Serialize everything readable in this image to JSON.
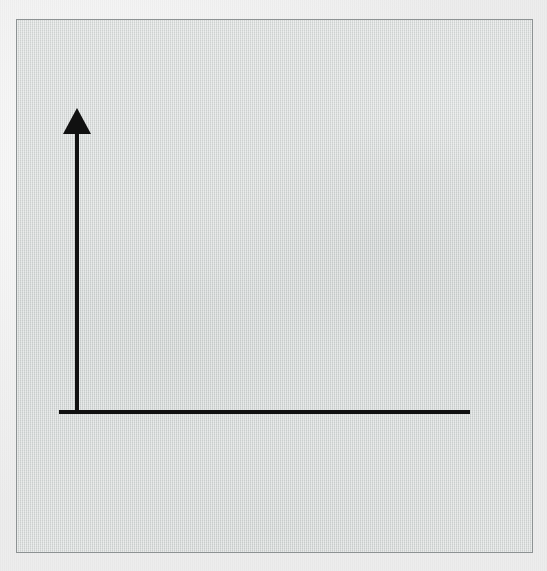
{
  "figure": {
    "kind": "blank-coordinate-axes-diagram",
    "canvas": {
      "width": 547,
      "height": 571
    },
    "caption": ""
  },
  "colors": {
    "page_background": "#f5f5f5",
    "panel_fill": "#dcdfde",
    "panel_border": "#8d9293",
    "axis_stroke": "#111111"
  },
  "panel": {
    "label": "diagram-panel",
    "left": 16,
    "top": 19,
    "width": 517,
    "height": 534,
    "border_width": 1
  },
  "chart_data": {
    "type": "line",
    "title": "",
    "subtitle": "",
    "xlabel": "",
    "ylabel": "",
    "categories": [],
    "series": [],
    "values": [],
    "x": [],
    "xlim": [
      0,
      1
    ],
    "ylim": [
      0,
      1
    ],
    "grid": false,
    "legend": "none",
    "annotations": [],
    "tick_labels": {
      "x": [],
      "y": []
    },
    "axes_geometry": {
      "origin": {
        "x": 76,
        "y": 411
      },
      "y_axis": {
        "name": "vertical-axis",
        "from": {
          "x": 76,
          "y": 411
        },
        "to": {
          "x": 76,
          "y": 133
        },
        "stroke_width": 4,
        "arrowhead": {
          "present": true,
          "style": "solid-triangle",
          "direction": "up",
          "tip": {
            "x": 76,
            "y": 107
          },
          "base_y": 133,
          "half_width": 14
        }
      },
      "x_axis": {
        "name": "horizontal-axis",
        "from": {
          "x": 58,
          "y": 411
        },
        "to": {
          "x": 469,
          "y": 411
        },
        "stroke_width": 4,
        "arrowhead": {
          "present": false,
          "style": "flat-end"
        }
      }
    }
  }
}
